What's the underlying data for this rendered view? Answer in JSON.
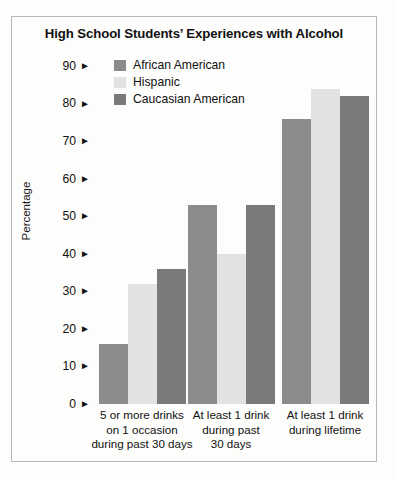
{
  "chart_data": {
    "type": "bar",
    "title": "High School Students’ Experiences with Alcohol",
    "xlabel": "",
    "ylabel": "Percentage",
    "ylim": [
      0,
      90
    ],
    "ytick_step": 10,
    "grid": false,
    "legend_position": "top-left-inside",
    "tick_marker": "►",
    "categories": [
      "5 or more drinks on 1 occasion during past 30 days",
      "At least 1 drink during past 30 days",
      "At least 1 drink during lifetime"
    ],
    "category_lines": [
      [
        "5 or more drinks",
        "on 1 occasion",
        "during past 30 days"
      ],
      [
        "At least 1 drink",
        "during past",
        "30 days"
      ],
      [
        "At least 1 drink",
        "during lifetime"
      ]
    ],
    "yticks": [
      "0",
      "10",
      "20",
      "30",
      "40",
      "50",
      "60",
      "70",
      "80",
      "90"
    ],
    "series": [
      {
        "name": "African American",
        "color": "#8c8c8c",
        "values": [
          16,
          53,
          76
        ]
      },
      {
        "name": "Hispanic",
        "color": "#e2e2e2",
        "values": [
          32,
          40,
          84
        ]
      },
      {
        "name": "Caucasian American",
        "color": "#7a7a7a",
        "values": [
          36,
          53,
          82
        ]
      }
    ]
  },
  "colors": {
    "border": "#b9b9b9",
    "page_background": "#fdfdfc",
    "text": "#111111",
    "african_american": "#8c8c8c",
    "hispanic": "#e2e2e2",
    "caucasian_american": "#7a7a7a"
  }
}
